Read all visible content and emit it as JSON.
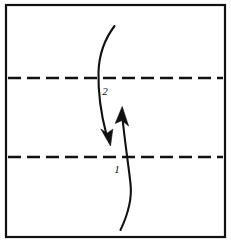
{
  "diagram": {
    "type": "origami-fold-step",
    "background_color": "#ffffff",
    "ink_color": "#111111",
    "paper": {
      "name": "square-paper-sheet",
      "x": 6,
      "y": 5,
      "width": 219,
      "height": 232,
      "stroke_width": 2.2,
      "fill": "#ffffff",
      "stroke_color": "#111111"
    },
    "crease_lines": [
      {
        "name": "upper-crease-line",
        "style": "dashed",
        "y": 78,
        "x_start": 8,
        "x_end": 223,
        "dash": "13 6",
        "stroke_width": 2.6,
        "color": "#111111"
      },
      {
        "name": "lower-crease-line",
        "style": "dashed",
        "y": 157,
        "x_start": 8,
        "x_end": 223,
        "dash": "13 6",
        "stroke_width": 2.6,
        "color": "#111111"
      }
    ],
    "arrows": [
      {
        "name": "fold-arrow-1",
        "label": "1",
        "label_x": 117,
        "label_y": 172,
        "direction": "up",
        "path": "M 120.5 230 C 129 212 132 198 130.5 184 C 129 168 125 144 122.5 118",
        "stroke_width": 2.1,
        "head": "M 122.2 107 L 128.2 125.5 L 122.0 120.5 L 115.6 123.0 Z",
        "color": "#111111"
      },
      {
        "name": "fold-arrow-2",
        "label": "2",
        "label_x": 105,
        "label_y": 95,
        "direction": "down",
        "path": "M 114.5 26 C 104 40 99 56 98.5 72 C 98 92 101.5 116 106.5 135",
        "stroke_width": 2.1,
        "head": "M 110.5 146 L 101.0 129.5 L 107.0 133.0 L 112.5 129.5 Z",
        "color": "#111111"
      }
    ],
    "labels": [
      {
        "name": "fold-order-label-1",
        "text": "1"
      },
      {
        "name": "fold-order-label-2",
        "text": "2"
      }
    ]
  }
}
